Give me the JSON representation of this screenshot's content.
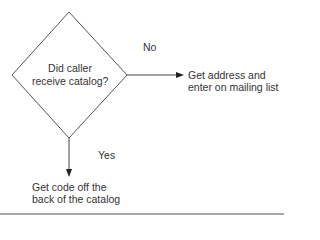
{
  "flowchart": {
    "decision": {
      "line1": "Did caller",
      "line2": "receive catalog?"
    },
    "no_branch": {
      "label": "No",
      "action_line1": "Get address and",
      "action_line2": "enter on mailing list"
    },
    "yes_branch": {
      "label": "Yes",
      "action_line1": "Get code off the",
      "action_line2": "back of the catalog"
    }
  },
  "colors": {
    "stroke": "#444444",
    "text": "#333333",
    "rule": "#888888"
  }
}
